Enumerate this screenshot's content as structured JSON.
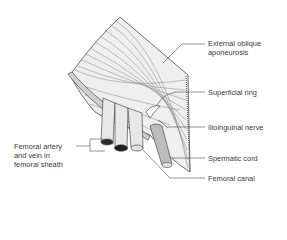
{
  "diagram": {
    "labels": {
      "external_oblique_line1": "External oblique",
      "external_oblique_line2": "aponeurosis",
      "superficial_ring": "Superficial ring",
      "ilioinguinal_nerve": "Ilioinguinal nerve",
      "spermatic_cord": "Spermatic cord",
      "femoral_canal": "Femoral canal",
      "femoral_artery_line1": "Femoral artery",
      "femoral_artery_line2": "and vein in",
      "femoral_artery_line3": "femoral sheath"
    },
    "colors": {
      "line": "#4a4a4a",
      "fill_light": "#e6e6e6",
      "fill_mid": "#bdbdbd",
      "fill_dark": "#2a2a2a",
      "text": "#3a3a3a"
    }
  }
}
